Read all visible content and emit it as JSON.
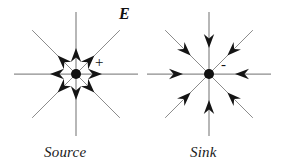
{
  "figure": {
    "title_symbol": "E",
    "background_color": "#ffffff",
    "line_color": "#8c8c8c",
    "arrow_color": "#141414",
    "dot_color": "#111111",
    "panels": [
      {
        "id": "source",
        "caption": "Source",
        "charge_sign": "+",
        "flow_direction": "outward",
        "center": {
          "x": 76,
          "y": 74
        },
        "ray_length": 62,
        "arrow_distance": 26,
        "dot_radius": 5,
        "ray_angles_deg": [
          0,
          45,
          90,
          135,
          180,
          225,
          270,
          315
        ]
      },
      {
        "id": "sink",
        "caption": "Sink",
        "charge_sign": "-",
        "flow_direction": "inward",
        "center": {
          "x": 209,
          "y": 74
        },
        "ray_length": 62,
        "arrow_distance": 26,
        "dot_radius": 5,
        "ray_angles_deg": [
          0,
          45,
          90,
          135,
          180,
          225,
          270,
          315
        ]
      }
    ]
  }
}
